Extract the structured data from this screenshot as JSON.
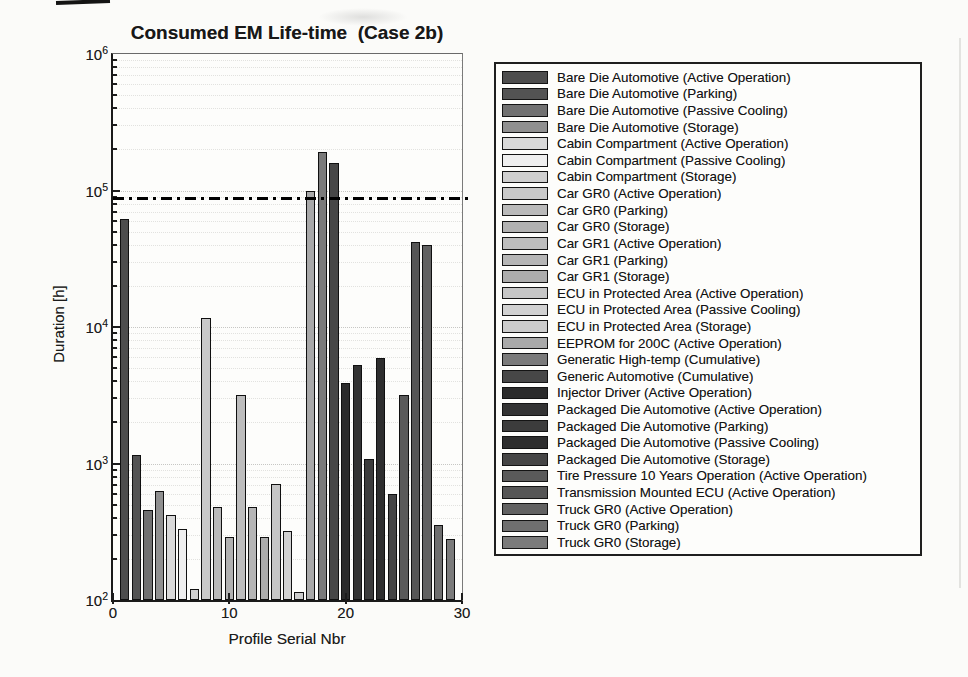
{
  "chart_data": {
    "type": "bar",
    "title": "Consumed EM Life-time  (Case 2b)",
    "xlabel": "Profile Serial Nbr",
    "ylabel": "Duration [h]",
    "y_scale": "log",
    "ylim": [
      100,
      1000000
    ],
    "y_tick_exponents": [
      2,
      3,
      4,
      5,
      6
    ],
    "xlim": [
      0,
      30
    ],
    "x_ticks": [
      0,
      10,
      20,
      30
    ],
    "grid": "horizontal dotted, log major and minor lines",
    "legend_position": "right",
    "grid_major_color": "#c7c7c4",
    "grid_minor_color": "#e2e2df",
    "bar_outline_color": "#101010",
    "reference_line": {
      "value": 87600,
      "style": "dash-dot",
      "color": "#000000"
    },
    "series": [
      {
        "x": 1,
        "label": "Bare Die Automotive (Active Operation)",
        "color": "#4d4d4d",
        "value": 62000
      },
      {
        "x": 2,
        "label": "Bare Die Automotive (Parking)",
        "color": "#535353",
        "value": 1150
      },
      {
        "x": 3,
        "label": "Bare Die Automotive (Passive Cooling)",
        "color": "#717171",
        "value": 460
      },
      {
        "x": 4,
        "label": "Bare Die Automotive (Storage)",
        "color": "#909090",
        "value": 630
      },
      {
        "x": 5,
        "label": "Cabin Compartment (Active Operation)",
        "color": "#d9d9d9",
        "value": 420
      },
      {
        "x": 6,
        "label": "Cabin Compartment (Passive Cooling)",
        "color": "#efefef",
        "value": 330
      },
      {
        "x": 7,
        "label": "Cabin Compartment (Storage)",
        "color": "#cfcfcf",
        "value": 120
      },
      {
        "x": 8,
        "label": "Car GR0 (Active Operation)",
        "color": "#c9c9c9",
        "value": 11700
      },
      {
        "x": 9,
        "label": "Car GR0 (Parking)",
        "color": "#b9b9b9",
        "value": 480
      },
      {
        "x": 10,
        "label": "Car GR0 (Storage)",
        "color": "#b1b1b1",
        "value": 290
      },
      {
        "x": 11,
        "label": "Car GR1 (Active Operation)",
        "color": "#bdbdbd",
        "value": 3200
      },
      {
        "x": 12,
        "label": "Car GR1 (Parking)",
        "color": "#b5b5b5",
        "value": 480
      },
      {
        "x": 13,
        "label": "Car GR1 (Storage)",
        "color": "#acacac",
        "value": 290
      },
      {
        "x": 14,
        "label": "ECU in Protected Area (Active Operation)",
        "color": "#c6c6c6",
        "value": 710
      },
      {
        "x": 15,
        "label": "ECU in Protected Area (Passive Cooling)",
        "color": "#d1d1d1",
        "value": 320
      },
      {
        "x": 16,
        "label": "ECU in Protected Area (Storage)",
        "color": "#cccccc",
        "value": 115
      },
      {
        "x": 17,
        "label": "EEPROM for 200C (Active Operation)",
        "color": "#a9a9a9",
        "value": 100000
      },
      {
        "x": 18,
        "label": "Generatic High-temp (Cumulative)",
        "color": "#7a7a7a",
        "value": 190000
      },
      {
        "x": 19,
        "label": "Generic Automotive (Cumulative)",
        "color": "#474747",
        "value": 160000
      },
      {
        "x": 20,
        "label": "Injector Driver (Active Operation)",
        "color": "#2b2b2b",
        "value": 3900
      },
      {
        "x": 21,
        "label": "Packaged Die Automotive (Active Operation)",
        "color": "#333333",
        "value": 5300
      },
      {
        "x": 22,
        "label": "Packaged Die Automotive (Parking)",
        "color": "#3c3c3c",
        "value": 1080
      },
      {
        "x": 23,
        "label": "Packaged Die Automotive (Passive Cooling)",
        "color": "#2e2e2e",
        "value": 5900
      },
      {
        "x": 24,
        "label": "Packaged Die Automotive (Storage)",
        "color": "#454545",
        "value": 600
      },
      {
        "x": 25,
        "label": "Tire Pressure 10 Years Operation (Active Operation)",
        "color": "#5a5a5a",
        "value": 3200
      },
      {
        "x": 26,
        "label": "Transmission Mounted ECU (Active Operation)",
        "color": "#565656",
        "value": 42000
      },
      {
        "x": 27,
        "label": "Truck GR0 (Active Operation)",
        "color": "#616161",
        "value": 40000
      },
      {
        "x": 28,
        "label": "Truck GR0 (Parking)",
        "color": "#6f6f6f",
        "value": 355
      },
      {
        "x": 29,
        "label": "Truck GR0 (Storage)",
        "color": "#7b7b7b",
        "value": 280
      }
    ]
  }
}
